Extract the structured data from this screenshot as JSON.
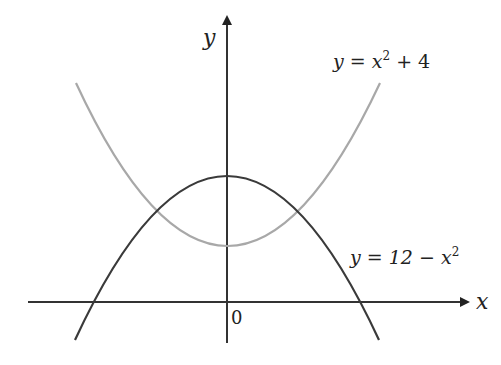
{
  "figure": {
    "axes": {
      "x_label": "x",
      "y_label": "y",
      "origin_label": "0"
    },
    "curves": [
      {
        "name": "upper-parabola",
        "equation_parts": {
          "lhs": "y = x",
          "exp": "2",
          "rhs": " + 4"
        },
        "equation": "y = x^2 + 4",
        "color": "#a6a6a6"
      },
      {
        "name": "lower-parabola",
        "equation_parts": {
          "lhs": "y = 12 − x",
          "exp": "2",
          "rhs": ""
        },
        "equation": "y = 12 − x^2",
        "color": "#3a3a3a"
      }
    ],
    "axis_color": "#222222"
  }
}
